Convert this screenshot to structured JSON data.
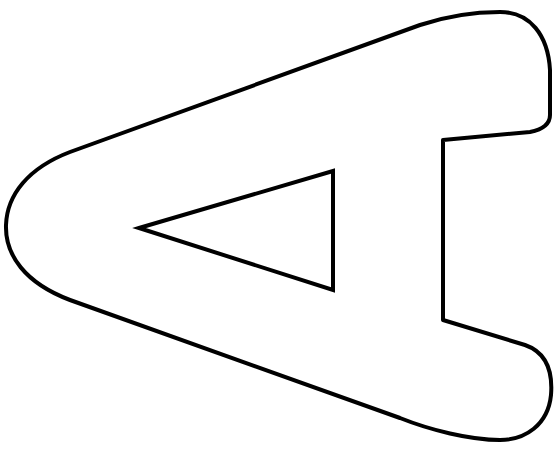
{
  "figure": {
    "subject": "Outline of a letter A rotated 90 degrees (apex pointing left)",
    "letter": "A",
    "rotation_degrees": -90,
    "stroke_color": "#000000",
    "fill_color": "#ffffff",
    "background_color": "#ffffff",
    "stroke_width": 4,
    "outer_outline_path": "M 500 12 C 530 12 548 35 550 70 L 550 115 C 550 125 540 130 530 132 L 443 140 L 443 320 L 525 345 C 545 352 553 370 551 395 C 548 425 525 440 500 440 C 470 440 430 430 400 418 L 70 300 C 25 283 5 255 6 225 C 7 195 28 168 70 152 L 420 25 C 450 15 475 12 500 12 Z",
    "inner_counter_path": "M 139 228 L 333 171 L 333 290 Z"
  }
}
